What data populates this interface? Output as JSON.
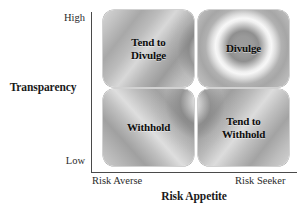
{
  "figure": {
    "axes": {
      "y": {
        "title": "Transparency",
        "ticks": {
          "high": "High",
          "low": "Low"
        }
      },
      "x": {
        "title": "Risk Appetite",
        "ticks": {
          "left": "Risk Averse",
          "right": "Risk Seeker"
        }
      }
    },
    "quadrants": [
      {
        "position": "top-left",
        "label": "Tend to\nDivulge"
      },
      {
        "position": "top-right",
        "label": "Divulge"
      },
      {
        "position": "bottom-left",
        "label": "Withhold"
      },
      {
        "position": "bottom-right",
        "label": "Tend to\nWithhold"
      }
    ]
  },
  "chart_data": {
    "type": "table",
    "title": "",
    "xlabel": "Risk Appetite",
    "ylabel": "Transparency",
    "x_ticks": [
      "Risk Averse",
      "Risk Seeker"
    ],
    "y_ticks": [
      "Low",
      "High"
    ],
    "grid": false,
    "legend": "none",
    "categories": [
      "Risk Averse",
      "Risk Seeker"
    ],
    "rows": [
      "High",
      "Low"
    ],
    "cells": [
      [
        "Tend to Divulge",
        "Divulge"
      ],
      [
        "Withhold",
        "Tend to Withhold"
      ]
    ]
  },
  "colors": {
    "axis_line": "#4a4a4a",
    "text": "#1a1a1a",
    "cell_light": "#dedede",
    "cell_mid": "#b8b8b8",
    "cell_dark": "#9c9c9c"
  }
}
